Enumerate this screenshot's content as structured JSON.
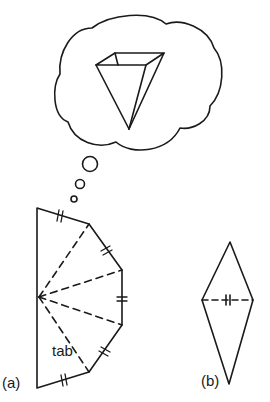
{
  "figure": {
    "thought_bubble": {
      "content": "inverted-pyramid-shape"
    },
    "panel_a": {
      "label": "(a)",
      "tab_label": "tab"
    },
    "panel_b": {
      "label": "(b)"
    }
  },
  "colors": {
    "stroke": "#1a1a1a",
    "background": "#ffffff"
  }
}
